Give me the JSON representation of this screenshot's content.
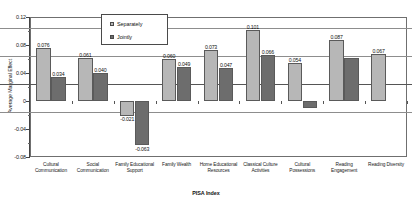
{
  "chart_data": {
    "type": "bar",
    "title": "",
    "xlabel": "PISA Index",
    "ylabel": "Average Marginal Effect",
    "ylim": [
      -0.08,
      0.12
    ],
    "yticks": [
      0.12,
      0.08,
      0.04,
      0,
      -0.04,
      -0.08
    ],
    "ytick_labels": [
      "0.12",
      "0.08",
      "0.04",
      "0",
      "-0.04",
      "-0.08"
    ],
    "grid": true,
    "legend_position": "top-center",
    "categories": [
      "Cultural Communication",
      "Social Communication",
      "Family Educational Support",
      "Family Wealth",
      "Home Educational Resources",
      "Classical Culture Activities",
      "Cultural Possessions",
      "Reading Engagement",
      "Reading Diversity"
    ],
    "series": [
      {
        "name": "Separately",
        "color": "#b7b7b7",
        "values": [
          0.076,
          0.061,
          -0.021,
          0.06,
          0.073,
          0.101,
          0.054,
          0.087,
          0.067
        ],
        "labels": [
          "0.076",
          "0.061",
          "-0.021",
          "0.060",
          "0.073",
          "0.101",
          "0.054",
          "0.087",
          "0.067"
        ]
      },
      {
        "name": "Jointly",
        "color": "#6d6d6d",
        "values": [
          0.034,
          0.04,
          -0.063,
          0.049,
          0.047,
          0.066,
          -0.01,
          0.062,
          0.0
        ],
        "labels": [
          "0.034",
          "0.040",
          "-0.063",
          "0.049",
          "0.047",
          "0.066",
          "",
          ""
        ]
      }
    ]
  },
  "legend": {
    "items": [
      {
        "label": "Separately"
      },
      {
        "label": "Jointly"
      }
    ]
  }
}
